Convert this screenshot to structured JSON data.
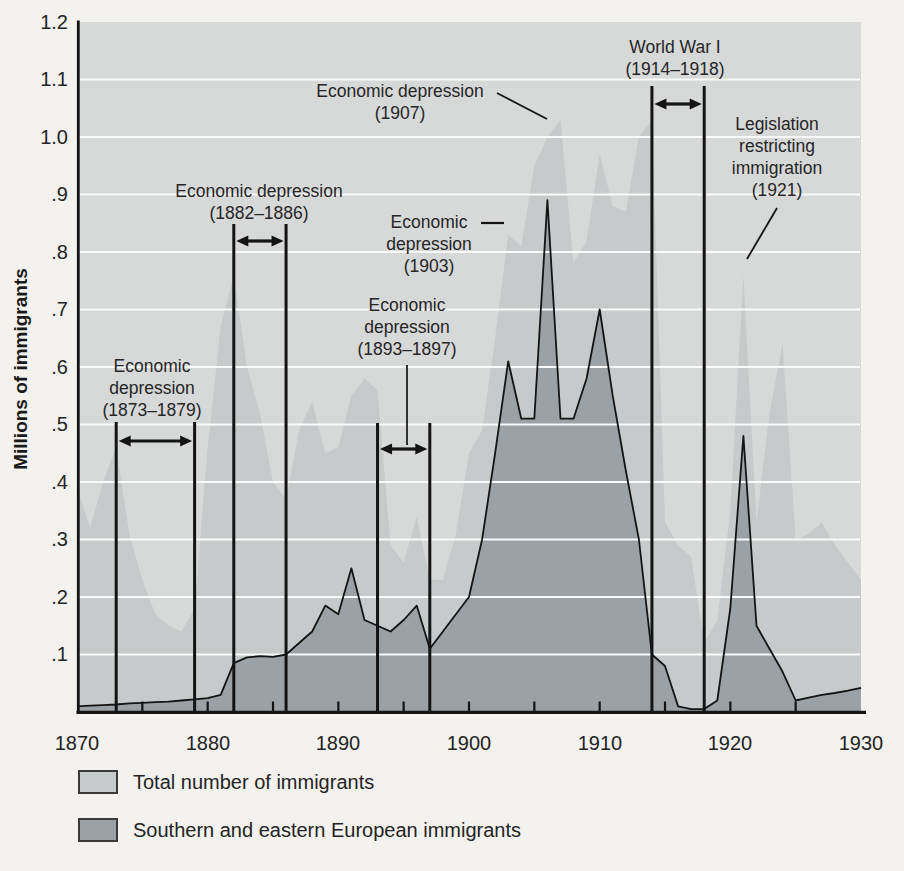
{
  "chart_data": {
    "type": "area",
    "title": "",
    "xlabel": "",
    "ylabel": "Millions of immigrants",
    "xlim": [
      1870,
      1930
    ],
    "ylim": [
      0,
      1.2
    ],
    "grid": "horizontal-white-gridlines",
    "legend_position": "bottom-left",
    "y_ticks": [
      "1.2",
      "1.1",
      "1.0",
      ".9",
      ".8",
      ".7",
      ".6",
      ".5",
      ".4",
      ".3",
      ".2",
      ".1"
    ],
    "x_ticks": [
      "1870",
      "1880",
      "1890",
      "1900",
      "1910",
      "1920",
      "1930"
    ],
    "minor_x_ticks_every_years": 5,
    "years": [
      1870,
      1871,
      1872,
      1873,
      1874,
      1875,
      1876,
      1877,
      1878,
      1879,
      1880,
      1881,
      1882,
      1883,
      1884,
      1885,
      1886,
      1887,
      1888,
      1889,
      1890,
      1891,
      1892,
      1893,
      1894,
      1895,
      1896,
      1897,
      1898,
      1899,
      1900,
      1901,
      1902,
      1903,
      1904,
      1905,
      1906,
      1907,
      1908,
      1909,
      1910,
      1911,
      1912,
      1913,
      1914,
      1915,
      1916,
      1917,
      1918,
      1919,
      1920,
      1921,
      1922,
      1923,
      1924,
      1925,
      1926,
      1927,
      1928,
      1929,
      1930
    ],
    "series": [
      {
        "name": "Total number of immigrants",
        "fill": "#c7cacb",
        "values": [
          0.39,
          0.32,
          0.4,
          0.46,
          0.31,
          0.23,
          0.17,
          0.15,
          0.14,
          0.18,
          0.46,
          0.67,
          0.76,
          0.6,
          0.52,
          0.4,
          0.37,
          0.49,
          0.54,
          0.45,
          0.46,
          0.55,
          0.58,
          0.56,
          0.29,
          0.26,
          0.34,
          0.23,
          0.23,
          0.31,
          0.45,
          0.49,
          0.65,
          0.83,
          0.81,
          0.95,
          1.0,
          1.03,
          0.78,
          0.82,
          0.97,
          0.88,
          0.87,
          1.0,
          1.03,
          0.33,
          0.29,
          0.27,
          0.12,
          0.16,
          0.35,
          0.76,
          0.33,
          0.52,
          0.64,
          0.3,
          0.31,
          0.33,
          0.29,
          0.26,
          0.23
        ]
      },
      {
        "name": "Southern and eastern European immigrants",
        "fill": "#9ba1a5",
        "outline": "#141414",
        "values": [
          0.01,
          0.011,
          0.012,
          0.013,
          0.015,
          0.016,
          0.017,
          0.018,
          0.02,
          0.022,
          0.024,
          0.03,
          0.085,
          0.095,
          0.097,
          0.096,
          0.1,
          0.12,
          0.14,
          0.185,
          0.17,
          0.25,
          0.16,
          0.15,
          0.14,
          0.16,
          0.185,
          0.11,
          0.14,
          0.17,
          0.2,
          0.3,
          0.45,
          0.61,
          0.51,
          0.51,
          0.89,
          0.51,
          0.51,
          0.58,
          0.7,
          0.55,
          0.42,
          0.3,
          0.1,
          0.08,
          0.01,
          0.005,
          0.005,
          0.02,
          0.18,
          0.48,
          0.15,
          0.11,
          0.07,
          0.02,
          0.025,
          0.03,
          0.033,
          0.037,
          0.042
        ]
      }
    ],
    "annotations": [
      {
        "id": "depression-1873-1879",
        "lines": [
          "Economic",
          "depression",
          "(1873–1879)"
        ],
        "period": [
          1873,
          1879
        ]
      },
      {
        "id": "depression-1882-1886",
        "lines": [
          "Economic depression",
          "(1882–1886)"
        ],
        "period": [
          1882,
          1886
        ]
      },
      {
        "id": "depression-1893-1897",
        "lines": [
          "Economic",
          "depression",
          "(1893–1897)"
        ],
        "period": [
          1893,
          1897
        ]
      },
      {
        "id": "depression-1903",
        "lines": [
          "Economic",
          "depression",
          "(1903)"
        ]
      },
      {
        "id": "depression-1907",
        "lines": [
          "Economic depression",
          "(1907)"
        ]
      },
      {
        "id": "world-war-1",
        "lines": [
          "World War I",
          "(1914–1918)"
        ],
        "period": [
          1914,
          1918
        ]
      },
      {
        "id": "legislation-1921",
        "lines": [
          "Legislation",
          "restricting",
          "immigration",
          "(1921)"
        ]
      }
    ],
    "colors": {
      "page_bg": "#f3f2ee",
      "plot_bg": "#d7d8d8",
      "total_fill": "#c7cacb",
      "southern_fill": "#9ba1a5",
      "gridline": "#fafafa",
      "line": "#141414",
      "text": "#242424"
    }
  }
}
